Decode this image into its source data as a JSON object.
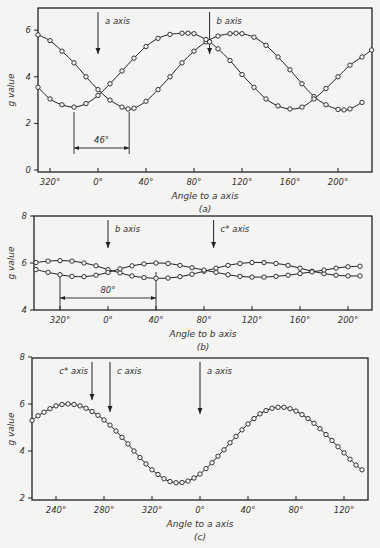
{
  "chart_data": [
    {
      "type": "line",
      "panel_label": "(a)",
      "title": "",
      "xlabel": "Angle to a axis",
      "ylabel": "g value",
      "ylim": [
        0,
        7
      ],
      "yticks": [
        0,
        2,
        4,
        6
      ],
      "ytick_labels": [
        "0",
        "2",
        "4",
        "6"
      ],
      "xticks": [
        -40,
        0,
        40,
        80,
        120,
        160,
        200
      ],
      "xtick_labels": [
        "320°",
        "0°",
        "40°",
        "80°",
        "120°",
        "160°",
        "200°"
      ],
      "xlim": [
        -50,
        228
      ],
      "frame": {
        "left": 38,
        "right": 372,
        "top": 8,
        "bottom": 172,
        "x0": 98,
        "y0": 170,
        "xscale": 1.2,
        "yscale": 23.3,
        "ymin": 0
      },
      "annotations": [
        {
          "type": "arrow",
          "label": "a axis",
          "x": 0
        },
        {
          "type": "arrow",
          "label": "b axis",
          "x": 93
        },
        {
          "type": "span",
          "label": "46°",
          "x1": -20,
          "x2": 26
        }
      ],
      "series": [
        {
          "name": "curve 1",
          "marker": "open-circle",
          "x": [
            -50,
            -40,
            -30,
            -20,
            -10,
            0,
            10,
            20,
            25,
            30,
            40,
            50,
            60,
            70,
            80,
            90,
            100,
            110,
            115,
            120,
            130,
            140,
            150,
            160,
            170,
            180,
            190,
            200,
            205,
            210,
            220
          ],
          "values": [
            5.8,
            5.55,
            5.1,
            4.6,
            4.0,
            3.45,
            3.0,
            2.7,
            2.62,
            2.65,
            2.95,
            3.45,
            4.0,
            4.6,
            5.1,
            5.5,
            5.75,
            5.85,
            5.87,
            5.85,
            5.7,
            5.35,
            4.85,
            4.3,
            3.7,
            3.15,
            2.8,
            2.6,
            2.58,
            2.62,
            2.9
          ]
        },
        {
          "name": "curve 2",
          "marker": "open-circle",
          "x": [
            -50,
            -40,
            -30,
            -20,
            -10,
            0,
            10,
            20,
            30,
            40,
            50,
            60,
            70,
            75,
            80,
            90,
            93,
            100,
            110,
            120,
            130,
            140,
            150,
            160,
            170,
            180,
            190,
            200,
            210,
            220,
            228
          ],
          "values": [
            3.55,
            3.05,
            2.8,
            2.7,
            2.85,
            3.2,
            3.7,
            4.25,
            4.8,
            5.3,
            5.65,
            5.82,
            5.87,
            5.87,
            5.85,
            5.6,
            5.5,
            5.2,
            4.7,
            4.1,
            3.55,
            3.05,
            2.75,
            2.62,
            2.7,
            3.05,
            3.5,
            4.0,
            4.5,
            4.85,
            5.15
          ]
        }
      ]
    },
    {
      "type": "line",
      "panel_label": "(b)",
      "title": "",
      "xlabel": "Angle to b axis",
      "ylabel": "g value",
      "ylim": [
        4,
        8
      ],
      "yticks": [
        4,
        6,
        8
      ],
      "ytick_labels": [
        "4",
        "6",
        "8"
      ],
      "xticks": [
        -40,
        0,
        40,
        80,
        120,
        160,
        200
      ],
      "xtick_labels": [
        "320°",
        "0°",
        "40°",
        "80°",
        "120°",
        "160°",
        "200°"
      ],
      "xlim": [
        -62,
        220
      ],
      "frame": {
        "left": 34,
        "right": 372,
        "top": 216,
        "bottom": 310,
        "x0": 108,
        "y0": 310,
        "xscale": 1.2,
        "yscale": 23.5,
        "ymin": 4
      },
      "annotations": [
        {
          "type": "arrow",
          "label": "b axis",
          "x": 0
        },
        {
          "type": "arrow",
          "label": "c* axis",
          "x": 88
        },
        {
          "type": "span",
          "label": "80°",
          "x1": -40,
          "x2": 40
        }
      ],
      "series": [
        {
          "name": "curve 1",
          "marker": "open-circle",
          "x": [
            -60,
            -50,
            -40,
            -30,
            -20,
            -10,
            0,
            10,
            20,
            30,
            40,
            50,
            60,
            70,
            80,
            90,
            100,
            110,
            120,
            130,
            140,
            150,
            160,
            170,
            180,
            190,
            200,
            210
          ],
          "values": [
            6.02,
            6.08,
            6.1,
            6.08,
            6.0,
            5.88,
            5.72,
            5.58,
            5.45,
            5.38,
            5.35,
            5.36,
            5.42,
            5.52,
            5.65,
            5.78,
            5.9,
            5.98,
            6.02,
            6.02,
            5.98,
            5.9,
            5.78,
            5.65,
            5.55,
            5.48,
            5.45,
            5.45
          ]
        },
        {
          "name": "curve 2",
          "marker": "open-circle",
          "x": [
            -60,
            -50,
            -40,
            -30,
            -20,
            -10,
            0,
            10,
            20,
            30,
            40,
            50,
            60,
            70,
            80,
            90,
            100,
            110,
            120,
            130,
            140,
            150,
            160,
            170,
            180,
            190,
            200,
            210
          ],
          "values": [
            5.72,
            5.6,
            5.5,
            5.43,
            5.42,
            5.48,
            5.6,
            5.75,
            5.88,
            5.96,
            6.0,
            5.98,
            5.9,
            5.8,
            5.7,
            5.6,
            5.5,
            5.43,
            5.4,
            5.4,
            5.43,
            5.48,
            5.55,
            5.62,
            5.7,
            5.78,
            5.84,
            5.86
          ]
        }
      ]
    },
    {
      "type": "line",
      "panel_label": "(c)",
      "title": "",
      "xlabel": "Angle to a axis",
      "ylabel": "g value",
      "ylim": [
        2,
        8
      ],
      "yticks": [
        2,
        4,
        6,
        8
      ],
      "ytick_labels": [
        "2",
        "4",
        "6",
        "8"
      ],
      "xticks": [
        -120,
        -80,
        -40,
        0,
        40,
        80,
        120
      ],
      "xtick_labels": [
        "240°",
        "280°",
        "320°",
        "0°",
        "40°",
        "80°",
        "120°"
      ],
      "xlim": [
        -140,
        140
      ],
      "frame": {
        "left": 32,
        "right": 368,
        "top": 358,
        "bottom": 500,
        "x0": 200,
        "y0": 498,
        "xscale": 1.2,
        "yscale": 23.5,
        "ymin": 2
      },
      "annotations": [
        {
          "type": "arrow",
          "label": "c* axis",
          "x": -90
        },
        {
          "type": "arrow",
          "label": "c axis",
          "x": -75
        },
        {
          "type": "arrow",
          "label": "a axis",
          "x": 0
        }
      ],
      "series": [
        {
          "name": "curve 1",
          "marker": "open-circle",
          "x": [
            -140,
            -135,
            -130,
            -125,
            -120,
            -115,
            -110,
            -105,
            -100,
            -95,
            -90,
            -85,
            -80,
            -75,
            -70,
            -65,
            -60,
            -55,
            -50,
            -45,
            -40,
            -35,
            -30,
            -25,
            -20,
            -15,
            -10,
            -5,
            0,
            5,
            10,
            15,
            20,
            25,
            30,
            35,
            40,
            45,
            50,
            55,
            60,
            65,
            70,
            75,
            80,
            85,
            90,
            95,
            100,
            105,
            110,
            115,
            120,
            125,
            130,
            135
          ],
          "values": [
            5.3,
            5.5,
            5.65,
            5.8,
            5.92,
            5.98,
            6.0,
            5.98,
            5.92,
            5.82,
            5.68,
            5.52,
            5.32,
            5.1,
            4.85,
            4.58,
            4.3,
            4.0,
            3.72,
            3.45,
            3.2,
            3.0,
            2.82,
            2.7,
            2.65,
            2.66,
            2.72,
            2.85,
            3.02,
            3.25,
            3.5,
            3.78,
            4.05,
            4.35,
            4.62,
            4.9,
            5.15,
            5.38,
            5.58,
            5.72,
            5.82,
            5.86,
            5.86,
            5.8,
            5.7,
            5.55,
            5.38,
            5.18,
            4.95,
            4.7,
            4.45,
            4.18,
            3.92,
            3.65,
            3.4,
            3.2
          ]
        }
      ]
    }
  ]
}
